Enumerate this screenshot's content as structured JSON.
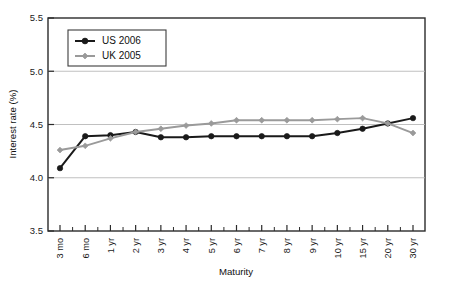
{
  "chart_data": {
    "type": "line",
    "title": "",
    "xlabel": "Maturity",
    "ylabel": "Interest rate (%)",
    "ylim": [
      3.5,
      5.5
    ],
    "ytick_step": 0.5,
    "yticks": [
      "3.5",
      "4.0",
      "4.5",
      "5.0",
      "5.5"
    ],
    "grid": true,
    "grid_axis": "y",
    "legend_position": "top-left-inside",
    "categories": [
      "3 mo",
      "6 mo",
      "1 yr",
      "2 yr",
      "3 yr",
      "4 yr",
      "5 yr",
      "6 yr",
      "7 yr",
      "8 yr",
      "9 yr",
      "10 yr",
      "15 yr",
      "20 yr",
      "30 yr"
    ],
    "series": [
      {
        "name": "US 2006",
        "color": "#1a1a1a",
        "marker": "circle",
        "values": [
          4.09,
          4.39,
          4.4,
          4.43,
          4.38,
          4.38,
          4.39,
          4.39,
          4.39,
          4.39,
          4.39,
          4.42,
          4.46,
          4.51,
          4.56
        ]
      },
      {
        "name": "UK 2005",
        "color": "#9a9a9a",
        "marker": "diamond",
        "values": [
          4.26,
          4.3,
          4.37,
          4.43,
          4.46,
          4.49,
          4.51,
          4.54,
          4.54,
          4.54,
          4.54,
          4.55,
          4.56,
          4.51,
          4.42
        ]
      }
    ]
  },
  "axis": {
    "y_title": "Interest rate (%)",
    "x_title": "Maturity"
  },
  "legend": {
    "entries": [
      {
        "label": "US 2006"
      },
      {
        "label": "UK 2005"
      }
    ]
  }
}
